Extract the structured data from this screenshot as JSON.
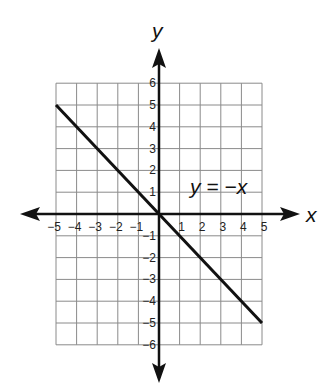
{
  "chart_data": {
    "type": "line",
    "title": "",
    "xlabel": "x",
    "ylabel": "y",
    "xlim": [
      -5,
      5
    ],
    "ylim": [
      -6,
      6
    ],
    "grid": true,
    "x_ticks": [
      -5,
      -4,
      -3,
      -2,
      -1,
      1,
      2,
      3,
      4,
      5
    ],
    "y_ticks": [
      6,
      5,
      4,
      3,
      2,
      1,
      -1,
      -2,
      -3,
      -4,
      -5,
      -6
    ],
    "x_tick_labels": [
      "−5",
      "−4",
      "−3",
      "−2",
      "−1",
      "1",
      "2",
      "3",
      "4",
      "5"
    ],
    "y_tick_labels": [
      "6",
      "5",
      "4",
      "3",
      "2",
      "1",
      "−1",
      "−2",
      "−3",
      "−4",
      "−5",
      "−6"
    ],
    "series": [
      {
        "name": "y = −x",
        "x": [
          -5,
          -4,
          -3,
          -2,
          -1,
          0,
          1,
          2,
          3,
          4,
          5
        ],
        "y": [
          5,
          4,
          3,
          2,
          1,
          0,
          -1,
          -2,
          -3,
          -4,
          -5
        ]
      }
    ],
    "annotations": [
      {
        "text": "y = −x",
        "x": 2.4,
        "y": 1
      }
    ]
  },
  "labels": {
    "x_axis": "x",
    "y_axis": "y",
    "equation": "y = −x"
  },
  "colors": {
    "grid": "#8a8a8a",
    "axis": "#111111",
    "line": "#111111"
  }
}
